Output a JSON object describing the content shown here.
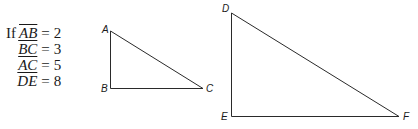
{
  "given": {
    "prefix": "If",
    "lines": [
      {
        "segment": "AB",
        "value": "2"
      },
      {
        "segment": "BC",
        "value": "3"
      },
      {
        "segment": "AC",
        "value": "5"
      },
      {
        "segment": "DE",
        "value": "8"
      }
    ],
    "equals": "="
  },
  "triangles": [
    {
      "name": "ABC",
      "vertices": [
        "A",
        "B",
        "C"
      ],
      "right_angle_at": "B"
    },
    {
      "name": "DEF",
      "vertices": [
        "D",
        "E",
        "F"
      ],
      "right_angle_at": "E"
    }
  ],
  "labels": {
    "A": "A",
    "B": "B",
    "C": "C",
    "D": "D",
    "E": "E",
    "F": "F"
  }
}
